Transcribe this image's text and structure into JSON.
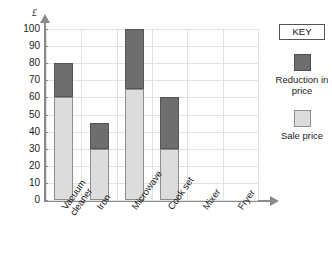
{
  "chart_data": {
    "type": "bar",
    "stacked": true,
    "title": "",
    "xlabel": "",
    "ylabel": "£",
    "ylim": [
      0,
      100
    ],
    "ytick_step": 10,
    "ytick_labels": [
      "0",
      "10",
      "20",
      "30",
      "40",
      "50",
      "60",
      "70",
      "80",
      "90",
      "100"
    ],
    "grid": true,
    "categories": [
      "Vacuum cleaner",
      "Iron",
      "Microwave",
      "Cook set",
      "Mixer",
      "Fryer"
    ],
    "category_lines": [
      [
        "Vacuum",
        "cleaner"
      ],
      [
        "Iron"
      ],
      [
        "Microwave"
      ],
      [
        "Cook set"
      ],
      [
        "Mixer"
      ],
      [
        "Fryer"
      ]
    ],
    "series": [
      {
        "name": "Sale price",
        "color": "#dcdcdc",
        "values": [
          60,
          30,
          65,
          30,
          null,
          null
        ]
      },
      {
        "name": "Reduction in price",
        "color": "#6e6e6e",
        "values": [
          20,
          15,
          35,
          30,
          null,
          null
        ]
      }
    ],
    "bar_totals": [
      80,
      45,
      100,
      60,
      null,
      null
    ],
    "legend_position": "right"
  },
  "legend": {
    "title": "KEY",
    "entries": [
      {
        "label_line1": "Reduction",
        "label_line2": "in price",
        "swatch": "dark"
      },
      {
        "label_line1": "Sale",
        "label_line2": "price",
        "swatch": "light"
      }
    ]
  },
  "colors": {
    "reduction": "#6e6e6e",
    "sale": "#dcdcdc",
    "axis": "#8a8a8a",
    "grid": "#e3e3e3"
  }
}
